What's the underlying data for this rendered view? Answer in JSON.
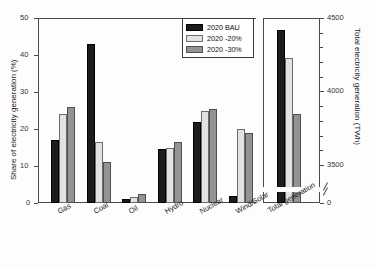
{
  "chart_data": {
    "type": "bar",
    "title": "",
    "categories": [
      "Gas",
      "Coal",
      "Oil",
      "Hydro",
      "Nuclear",
      "Wind/Solar"
    ],
    "series": [
      {
        "name": "2020 BAU",
        "color": "#1c1c1c",
        "values": [
          17,
          43,
          1,
          14.5,
          22,
          2
        ]
      },
      {
        "name": "2020 -20%",
        "color": "#e2e2e2",
        "values": [
          24,
          16.5,
          1.5,
          15,
          25,
          20
        ]
      },
      {
        "name": "2020 -30%",
        "color": "#939393",
        "values": [
          26,
          11,
          2.5,
          16.5,
          25.5,
          19
        ]
      }
    ],
    "ylabel": "Share of electricity generation (%)",
    "ylim": [
      0,
      50
    ],
    "yticks": [
      0,
      10,
      20,
      30,
      40,
      50
    ],
    "xlabel": "",
    "grid": false,
    "legend_position": "upper-right",
    "secondary_panel": {
      "category": "Total generation",
      "ylabel": "Total electricity generation (TWh)",
      "ylim": [
        3350,
        4500
      ],
      "yticks": [
        0,
        3500,
        4000,
        4500
      ],
      "axis_break": true,
      "values": [
        4420,
        4230,
        3850
      ]
    }
  },
  "axes": {
    "left": {
      "label": "Share of electricity generation (%)",
      "ticks": [
        "0",
        "10",
        "20",
        "30",
        "40",
        "50"
      ]
    },
    "right": {
      "label": "Total electricity generation (TWh)",
      "ticks": [
        "0",
        "3500",
        "4000",
        "4500"
      ]
    }
  },
  "legend": {
    "items": [
      {
        "label": "2020 BAU"
      },
      {
        "label": "2020 -20%"
      },
      {
        "label": "2020 -30%"
      }
    ]
  },
  "xlabels": {
    "left": [
      "Gas",
      "Coal",
      "Oil",
      "Hydro",
      "Nuclear",
      "Wind/Solar"
    ],
    "right": "Total generation"
  }
}
